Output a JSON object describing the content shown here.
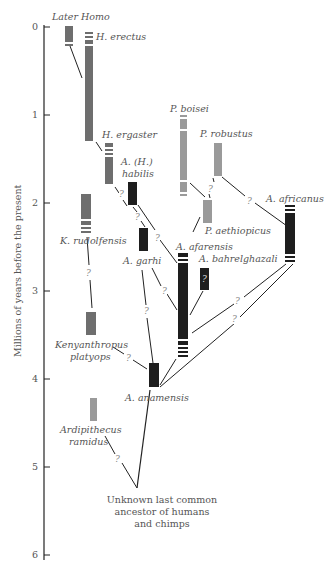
{
  "axis": {
    "label": "Millions of years before the present",
    "ticks": [
      "0",
      "1",
      "2",
      "3",
      "4",
      "5",
      "6"
    ]
  },
  "colors": {
    "homo_gray": "#6e6e6e",
    "paranthropus_gray": "#9a9a9a",
    "australopith_black": "#1e1e1e",
    "line": "#222222",
    "text": "#555555"
  },
  "species": {
    "later_homo": "Later Homo",
    "h_erectus": "H. erectus",
    "h_ergaster": "H. ergaster",
    "a_habilis_1": "A. (H.)",
    "a_habilis_2": "habilis",
    "k_rudolfensis": "K. rudolfensis",
    "a_garhi": "A. garhi",
    "p_boisei": "P. boisei",
    "p_robustus": "P. robustus",
    "p_aethiopicus": "P. aethiopicus",
    "a_africanus": "A. africanus",
    "a_afarensis": "A. afarensis",
    "a_bahrelghazali": "A. bahrelghazali",
    "kenyanthropus_1": "Kenyanthropus",
    "kenyanthropus_2": "platyops",
    "a_anamensis": "A. anamensis",
    "ardipithecus_1": "Ardipithecus",
    "ardipithecus_2": "ramidus"
  },
  "uncertain_mark": "?",
  "lca": {
    "line1": "Unknown last common",
    "line2": "ancestor of humans",
    "line3": "and chimps"
  }
}
